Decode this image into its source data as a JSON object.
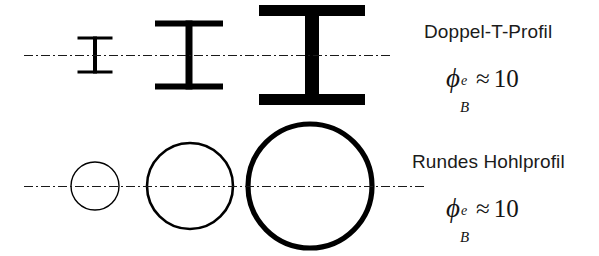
{
  "figure": {
    "background_color": "#ffffff",
    "ink_color": "#000000",
    "rows": [
      {
        "id": "doppel-t-row",
        "label": "Doppel-T-Profil",
        "axis_y": 55,
        "axis_x_start": 24,
        "axis_x_end": 391,
        "formula": {
          "symbol": "ϕ",
          "superscript": "e",
          "subscript": "B",
          "relation": "≈",
          "value": "10"
        },
        "shapes": [
          {
            "name": "i-beam-small",
            "type": "i-beam",
            "center_x": 95,
            "center_y": 55,
            "flange_width": 35,
            "height": 37,
            "flange_thickness": 3,
            "web_thickness": 4
          },
          {
            "name": "i-beam-medium",
            "type": "i-beam",
            "center_x": 189,
            "center_y": 55,
            "flange_width": 68,
            "height": 69,
            "flange_thickness": 6,
            "web_thickness": 7
          },
          {
            "name": "i-beam-large",
            "type": "i-beam",
            "center_x": 312,
            "center_y": 55,
            "flange_width": 106,
            "height": 100,
            "flange_thickness": 11,
            "web_thickness": 14
          }
        ]
      },
      {
        "id": "rundes-hohlprofil-row",
        "label": "Rundes Hohlprofil",
        "axis_y": 186,
        "axis_x_start": 24,
        "axis_x_end": 426,
        "formula": {
          "symbol": "ϕ",
          "superscript": "e",
          "subscript": "B",
          "relation": "≈",
          "value": "10"
        },
        "shapes": [
          {
            "name": "circle-small",
            "type": "circle",
            "center_x": 95,
            "center_y": 186,
            "radius": 24,
            "stroke_width": 1.4
          },
          {
            "name": "circle-medium",
            "type": "circle",
            "center_x": 190,
            "center_y": 186,
            "radius": 43,
            "stroke_width": 2.6
          },
          {
            "name": "circle-large",
            "type": "circle",
            "center_x": 310,
            "center_y": 186,
            "radius": 62,
            "stroke_width": 5.2
          }
        ]
      }
    ],
    "centerline": {
      "name": "dash-dot-axis",
      "dash_pattern": "9 3 2 3",
      "stroke_width": 1.1,
      "color": "#1a1a1a"
    }
  }
}
